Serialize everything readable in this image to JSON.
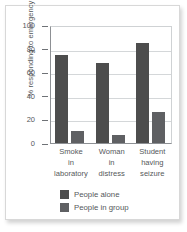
{
  "chart_data": {
    "type": "bar",
    "title": "",
    "xlabel": "",
    "ylabel": "% responding to emergency",
    "ylim": [
      0,
      100
    ],
    "yticks": [
      100,
      80,
      60,
      40,
      20,
      0
    ],
    "grid": true,
    "legend_position": "bottom-center",
    "categories": [
      "Smoke in laboratory",
      "Woman in distress",
      "Student having seizure"
    ],
    "category_lines": [
      [
        "Smoke",
        "in",
        "laboratory"
      ],
      [
        "Woman",
        "in",
        "distress"
      ],
      [
        "Student",
        "having",
        "seizure"
      ]
    ],
    "series": [
      {
        "name": "People alone",
        "color": "#4d4d4d",
        "values": [
          75,
          68,
          85
        ]
      },
      {
        "name": "People in group",
        "color": "#5f6063",
        "values": [
          10,
          7,
          26
        ]
      }
    ]
  },
  "colors": {
    "series_alone": "#4d4d4d",
    "series_group": "#5f6063",
    "axis": "#8d9094",
    "grid": "#d4d7d9",
    "text": "#55585a",
    "frame": "#d8d8d8",
    "background": "#ffffff"
  }
}
